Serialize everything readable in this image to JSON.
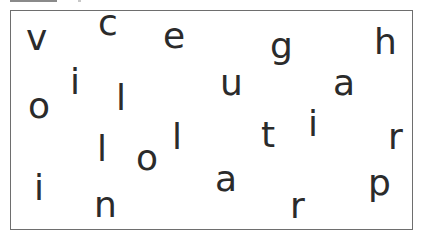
{
  "puzzle": {
    "description": "Scattered letters puzzle",
    "border_color": "#6e6e6e",
    "letter_color": "#2b2b2b",
    "letters": [
      {
        "char": "v",
        "x": 26,
        "y": 20
      },
      {
        "char": "c",
        "x": 98,
        "y": 5
      },
      {
        "char": "e",
        "x": 163,
        "y": 18
      },
      {
        "char": "h",
        "x": 374,
        "y": 24
      },
      {
        "char": "g",
        "x": 270,
        "y": 28
      },
      {
        "char": "i",
        "x": 70,
        "y": 64
      },
      {
        "char": "l",
        "x": 116,
        "y": 80
      },
      {
        "char": "u",
        "x": 220,
        "y": 65
      },
      {
        "char": "a",
        "x": 333,
        "y": 65
      },
      {
        "char": "o",
        "x": 28,
        "y": 88
      },
      {
        "char": "t",
        "x": 261,
        "y": 117
      },
      {
        "char": "i",
        "x": 308,
        "y": 106
      },
      {
        "char": "r",
        "x": 388,
        "y": 119
      },
      {
        "char": "l",
        "x": 97,
        "y": 131
      },
      {
        "char": "o",
        "x": 136,
        "y": 140
      },
      {
        "char": "l",
        "x": 172,
        "y": 119
      },
      {
        "char": "i",
        "x": 34,
        "y": 170
      },
      {
        "char": "n",
        "x": 94,
        "y": 187
      },
      {
        "char": "a",
        "x": 215,
        "y": 161
      },
      {
        "char": "r",
        "x": 290,
        "y": 188
      },
      {
        "char": "p",
        "x": 368,
        "y": 165
      }
    ]
  }
}
